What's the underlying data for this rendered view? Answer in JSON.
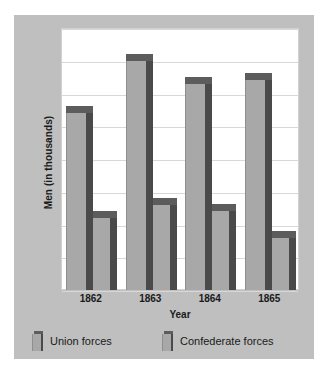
{
  "chart_data": {
    "type": "bar",
    "title": "",
    "subtitle": "",
    "xlabel": "Year",
    "ylabel": "Men (in thousands)",
    "categories": [
      "1862",
      "1863",
      "1864",
      "1865"
    ],
    "series": [
      {
        "name": "Union forces",
        "values": [
          540,
          700,
          630,
          640
        ]
      },
      {
        "name": "Confederate forces",
        "values": [
          220,
          260,
          240,
          160
        ]
      }
    ],
    "ylim": [
      0,
      800
    ],
    "ytick_values": [
      0,
      100,
      200,
      300,
      400,
      500,
      600,
      700,
      800
    ],
    "ytick_labels_visible": false,
    "grid": true,
    "grid_orientation": "horizontal",
    "legend_position": "bottom-left",
    "style_3d": true,
    "colors": {
      "bar_face": "#a8a8a8",
      "bar_side": "#4a4a4a",
      "bar_top": "#5c5c5c",
      "plot_background": "#ffffff",
      "card_background": "#bfbfbf",
      "gridline": "#d8d8d8",
      "text": "#1a1a1a"
    }
  },
  "axes": {
    "x_title": "Year",
    "y_title": "Men (in thousands)",
    "x_ticks": [
      "1862",
      "1863",
      "1864",
      "1865"
    ]
  },
  "legend": {
    "items": [
      {
        "label": "Union forces",
        "swatch": "union-swatch"
      },
      {
        "label": "Confederate forces",
        "swatch": "confederate-swatch"
      }
    ]
  }
}
